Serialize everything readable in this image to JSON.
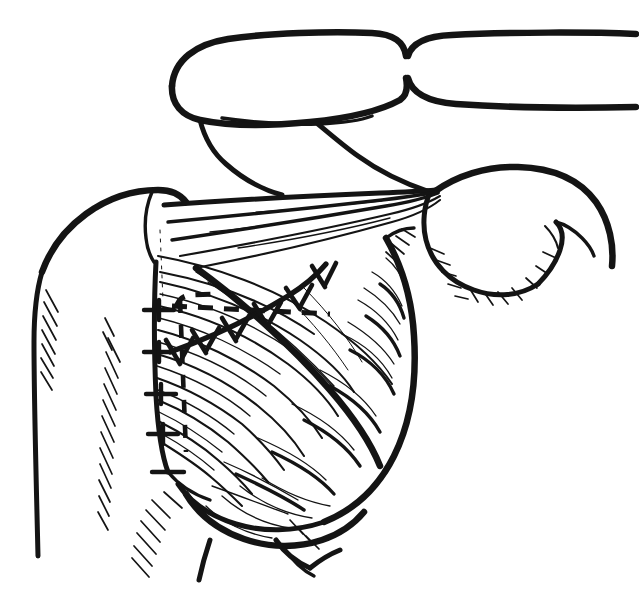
{
  "figure": {
    "kind": "line-drawing",
    "medium": "black ink line art",
    "background_color": "#ffffff",
    "ink_color": "#141414",
    "width": 639,
    "height": 589,
    "text_labels": [],
    "caption": ""
  },
  "structures": [
    {
      "id": "clavicle-left",
      "label": "clavicle",
      "region": "superior"
    },
    {
      "id": "clavicle-right",
      "label": "contralateral clavicle",
      "region": "superior-right"
    },
    {
      "id": "deltoid",
      "label": "deltoid muscle",
      "region": "left-shoulder"
    },
    {
      "id": "pectoralis-major",
      "label": "pectoralis major",
      "region": "center"
    },
    {
      "id": "upper-arm",
      "label": "upper arm / humerus",
      "region": "right"
    },
    {
      "id": "axillary-fold",
      "label": "axillary fold",
      "region": "right-center"
    },
    {
      "id": "breast-mound",
      "label": "breast tissue",
      "region": "inferior-center"
    },
    {
      "id": "inframammary-fold",
      "label": "inframammary fold",
      "region": "inferior"
    },
    {
      "id": "lateral-chest-wall",
      "label": "lateral chest wall",
      "region": "left"
    }
  ],
  "annotations": {
    "suture_line": {
      "name": "closed incision with interrupted sutures",
      "stitch_count": 6,
      "orientation": "oblique, inferomedial to superolateral"
    },
    "dashed_horizontal": {
      "name": "planned transverse incision marking",
      "style": "dashed"
    },
    "dashed_vertical": {
      "name": "planned vertical incision marking",
      "style": "dashed"
    },
    "margin_ticks": {
      "name": "medial margin tick marks",
      "count": 5
    }
  }
}
